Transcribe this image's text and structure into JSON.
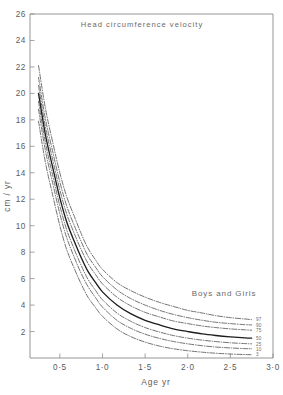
{
  "chart_data": {
    "type": "line",
    "title": "Head circumference velocity",
    "xlabel": "Age yr",
    "ylabel": "cm / yr",
    "annotation": "Boys and Girls",
    "xlim": [
      0.15,
      3.0
    ],
    "ylim": [
      0,
      26
    ],
    "grid": false,
    "legend_position": "right-inline-curve-labels",
    "xticks": [
      0.5,
      1.0,
      1.5,
      2.0,
      2.5,
      3.0
    ],
    "xticklabels": [
      "0·5",
      "1·0",
      "1·5",
      "2·0",
      "2·5",
      "3·0"
    ],
    "yticks": [
      2,
      4,
      6,
      8,
      10,
      12,
      14,
      16,
      18,
      20,
      22,
      24,
      26
    ],
    "yticklabels": [
      "2",
      "4",
      "6",
      "8",
      "10",
      "12",
      "14",
      "16",
      "18",
      "20",
      "22",
      "24",
      "26"
    ],
    "x": [
      0.25,
      0.33,
      0.42,
      0.5,
      0.58,
      0.67,
      0.75,
      0.83,
      0.92,
      1.0,
      1.17,
      1.33,
      1.5,
      1.67,
      1.83,
      2.0,
      2.17,
      2.33,
      2.5,
      2.67,
      2.75
    ],
    "series": [
      {
        "name": "97",
        "label": "97",
        "style": "dash-dot",
        "values": [
          22.1,
          18.9,
          16.2,
          14.0,
          12.2,
          10.7,
          9.4,
          8.3,
          7.4,
          6.7,
          5.7,
          5.1,
          4.6,
          4.2,
          3.9,
          3.6,
          3.4,
          3.2,
          3.05,
          2.95,
          2.9
        ]
      },
      {
        "name": "90",
        "label": "90",
        "style": "dash-dot",
        "values": [
          21.2,
          18.1,
          15.5,
          13.3,
          11.5,
          10.0,
          8.8,
          7.7,
          6.85,
          6.15,
          5.15,
          4.5,
          4.0,
          3.6,
          3.3,
          3.05,
          2.85,
          2.7,
          2.6,
          2.52,
          2.5
        ]
      },
      {
        "name": "75",
        "label": "75",
        "style": "dash-dot",
        "values": [
          20.6,
          17.5,
          14.9,
          12.7,
          10.9,
          9.4,
          8.2,
          7.15,
          6.3,
          5.6,
          4.6,
          3.95,
          3.45,
          3.1,
          2.8,
          2.6,
          2.42,
          2.3,
          2.2,
          2.13,
          2.1
        ]
      },
      {
        "name": "50",
        "label": "50",
        "style": "solid",
        "values": [
          20.0,
          16.9,
          14.3,
          12.1,
          10.3,
          8.8,
          7.6,
          6.55,
          5.7,
          5.0,
          4.0,
          3.35,
          2.85,
          2.5,
          2.2,
          2.0,
          1.82,
          1.7,
          1.6,
          1.52,
          1.5
        ]
      },
      {
        "name": "25",
        "label": "25",
        "style": "dash-dot",
        "values": [
          19.4,
          16.3,
          13.7,
          11.5,
          9.7,
          8.2,
          7.0,
          5.95,
          5.1,
          4.4,
          3.4,
          2.78,
          2.3,
          1.96,
          1.7,
          1.5,
          1.35,
          1.24,
          1.15,
          1.09,
          1.07
        ]
      },
      {
        "name": "10",
        "label": "10",
        "style": "dash-dot",
        "values": [
          18.8,
          15.7,
          13.1,
          10.9,
          9.1,
          7.6,
          6.4,
          5.4,
          4.55,
          3.85,
          2.85,
          2.25,
          1.8,
          1.48,
          1.25,
          1.07,
          0.93,
          0.83,
          0.76,
          0.71,
          0.7
        ]
      },
      {
        "name": "3",
        "label": "3",
        "style": "dash-dot",
        "values": [
          17.9,
          14.8,
          12.2,
          10.0,
          8.2,
          6.75,
          5.6,
          4.6,
          3.8,
          3.15,
          2.2,
          1.62,
          1.2,
          0.9,
          0.7,
          0.55,
          0.44,
          0.36,
          0.3,
          0.26,
          0.25
        ]
      }
    ]
  }
}
